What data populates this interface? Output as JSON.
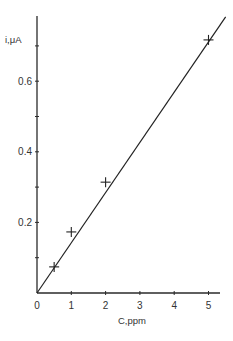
{
  "chart_data": {
    "type": "scatter",
    "title": "",
    "xlabel": "C,ppm",
    "ylabel": "i,μA",
    "xlim": [
      0,
      5.3
    ],
    "ylim": [
      0,
      0.78
    ],
    "x_ticks": [
      0,
      1,
      2,
      3,
      4,
      5
    ],
    "x_tick_labels": [
      "0",
      "1",
      "2",
      "3",
      "4",
      "5"
    ],
    "y_ticks": [
      0.1,
      0.2,
      0.3,
      0.4,
      0.5,
      0.6,
      0.7
    ],
    "y_tick_labels": [
      "",
      "0.2",
      "",
      "0.4",
      "",
      "0.6",
      ""
    ],
    "grid": false,
    "legend": null,
    "series": [
      {
        "name": "measured",
        "marker": "+",
        "x": [
          0.5,
          1.0,
          2.0,
          5.0
        ],
        "y": [
          0.074,
          0.173,
          0.314,
          0.717
        ]
      },
      {
        "name": "linear fit",
        "style": "line",
        "x": [
          0,
          5.5
        ],
        "y": [
          0,
          0.782
        ]
      }
    ]
  }
}
